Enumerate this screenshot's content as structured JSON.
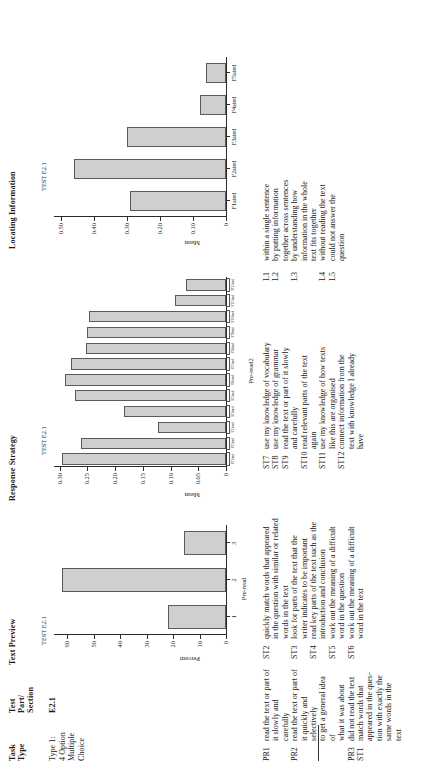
{
  "table": {
    "headers": [
      {
        "label": "Task\nType"
      },
      {
        "label": "Test\nPart/\nSection"
      },
      {
        "label": "Text Preview"
      },
      {
        "label": "Response Strategy"
      },
      {
        "label": "Locating Information"
      }
    ],
    "header_task_type": "Task\nType",
    "header_test_part": "Test\nPart/\nSection",
    "header_text_preview": "Text Preview",
    "header_response_strategy": "Response Strategy",
    "header_locating_information": "Locating Information",
    "row": {
      "task_type": "Type 1:\n4 Option\nMultiple\nChoice",
      "test_part": "E2.1"
    }
  },
  "chart_data": [
    {
      "type": "bar",
      "title": "TEST E2.1",
      "xlabel": "Pre-read",
      "ylabel": "Percent",
      "categories": [
        "1",
        "2",
        "3"
      ],
      "values": [
        22,
        62,
        16
      ],
      "ylim": [
        0,
        65
      ],
      "yticks": [
        10,
        20,
        30,
        40,
        50,
        60
      ],
      "ytick_labels": [
        "10",
        "20",
        "30",
        "40",
        "50",
        "60"
      ],
      "grid": false,
      "legend": "none",
      "bar_color": "#cfcfcf",
      "bar_border": "#5a5a5a"
    },
    {
      "type": "bar",
      "title": "TEST E2.1",
      "xlabel": "Pre-read2",
      "ylabel": "Mean",
      "categories": [
        "ST1ated",
        "ST2ated",
        "ST3ated",
        "ST4ated",
        "ST5ated",
        "ST6ated",
        "ST7ated",
        "ST8ated",
        "ST9ated",
        "ST10ated",
        "ST11ated",
        "ST12ated"
      ],
      "values": [
        0.295,
        0.262,
        0.122,
        0.183,
        0.272,
        0.29,
        0.28,
        0.252,
        0.25,
        0.247,
        0.092,
        0.072
      ],
      "ylim": [
        0,
        0.31
      ],
      "yticks": [
        0.05,
        0.1,
        0.15,
        0.2,
        0.25,
        0.3
      ],
      "ytick_labels": [
        "0.05",
        "0.10",
        "0.15",
        "0.20",
        "0.25",
        "0.30"
      ],
      "grid": false,
      "legend": "none",
      "bar_color": "#cfcfcf",
      "bar_border": "#5a5a5a"
    },
    {
      "type": "bar",
      "title": "TEST E2.1",
      "xlabel": "",
      "ylabel": "Mean",
      "categories": [
        "F1ated",
        "F2ated",
        "F3ated",
        "F4ated",
        "F5ated"
      ],
      "values": [
        0.29,
        0.46,
        0.3,
        0.08,
        0.06
      ],
      "ylim": [
        0,
        0.52
      ],
      "yticks": [
        0.1,
        0.2,
        0.3,
        0.4,
        0.5
      ],
      "ytick_labels": [
        "0.10",
        "0.20",
        "0.30",
        "0.40",
        "0.50"
      ],
      "grid": false,
      "legend": "none",
      "bar_color": "#cfcfcf",
      "bar_border": "#5a5a5a"
    }
  ],
  "legends": {
    "column_pr_st": [
      {
        "key": "PR1",
        "text": "read the text or part of\nit slowly and carefully"
      },
      {
        "key": "PR2",
        "text": "read the text or part of\nit quickly and selectively\nto get a general idea of\nwhat it was about"
      },
      {
        "key": "PR3",
        "text": "did not read the text"
      },
      {
        "key": "ST1",
        "text": "match words that\nappeared in the ques-\ntion with exactly the\nsame words in the text"
      }
    ],
    "column_st_mid": [
      {
        "key": "ST2",
        "text": "quickly match words that appeared\nin the question with similar or related\nwords in the text"
      },
      {
        "key": "ST3",
        "text": "look for parts of the text that the\nwriter indicates to be important"
      },
      {
        "key": "ST4",
        "text": "read key parts of the text such as the\nintroduction and conclusion"
      },
      {
        "key": "ST5",
        "text": "work out the meaning of a difficult\nword in the question"
      },
      {
        "key": "ST6",
        "text": "work out the meaning of a difficult\nword in the text"
      }
    ],
    "column_st_right": [
      {
        "key": "ST7",
        "text": "use my knowledge of vocabulary"
      },
      {
        "key": "ST8",
        "text": "use my knowledge of grammar"
      },
      {
        "key": "ST9",
        "text": "read the text or part of it slowly\nand carefully"
      },
      {
        "key": "ST10",
        "text": "read relevant parts of the text\nagain"
      },
      {
        "key": "ST11",
        "text": "use my knowledge of how texts\nlike this are organised"
      },
      {
        "key": "ST12",
        "text": "connect information from the\ntext with knowledge I already\nhave"
      }
    ],
    "column_l": [
      {
        "key": "L1",
        "text": "within a single sentence"
      },
      {
        "key": "L2",
        "text": "by putting information\ntogether across sentences"
      },
      {
        "key": "L3",
        "text": "by understanding how\ninformation in the whole\ntext fits together"
      },
      {
        "key": "L4",
        "text": "without reading the text"
      },
      {
        "key": "L5",
        "text": "could not answer the\nquestion"
      }
    ]
  }
}
